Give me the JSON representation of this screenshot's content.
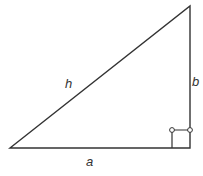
{
  "diagram": {
    "type": "right-triangle",
    "labels": {
      "hypotenuse": "h",
      "vertical_side": "b",
      "horizontal_side": "a"
    },
    "vertices": {
      "bottom_left": [
        10,
        148
      ],
      "bottom_right": [
        190,
        148
      ],
      "top": [
        190,
        6
      ]
    },
    "right_angle_marker": {
      "x": 172,
      "y": 130,
      "size": 18
    },
    "colors": {
      "stroke": "#333333",
      "background": "#ffffff"
    }
  }
}
